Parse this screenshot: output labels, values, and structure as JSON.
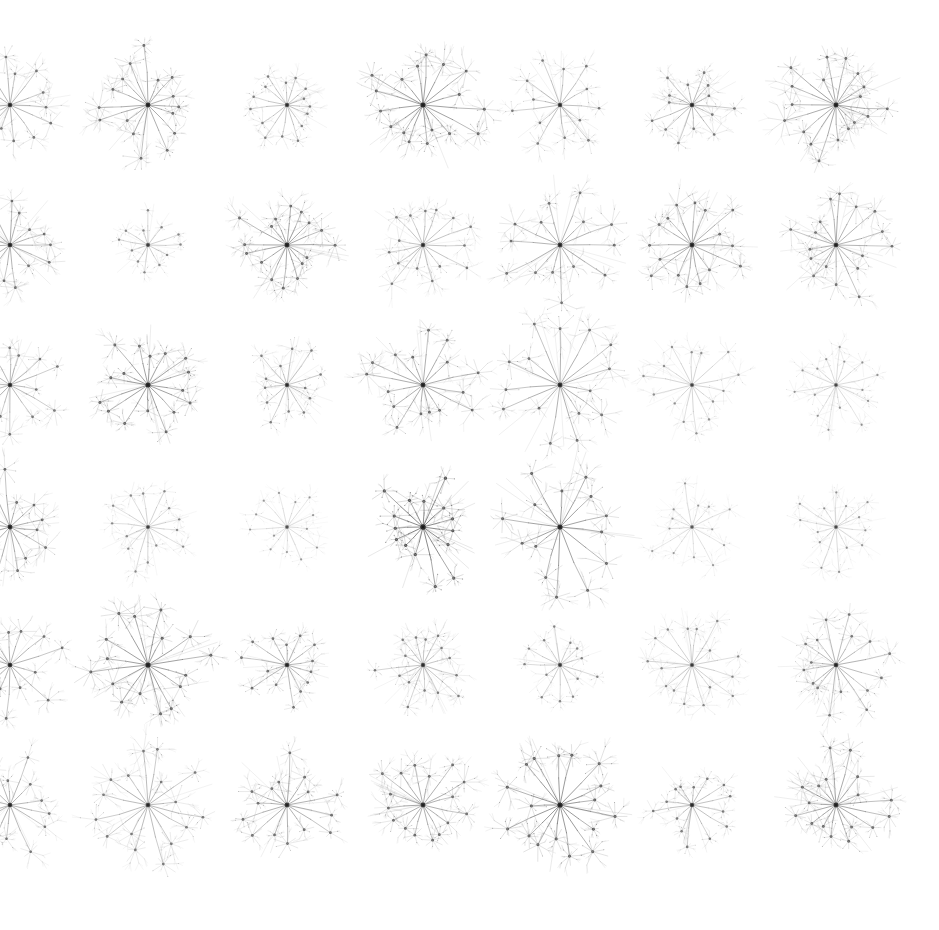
{
  "figure": {
    "type": "small-multiples-grid",
    "width": 939,
    "height": 930,
    "background_color": "#ffffff",
    "ink_color": "#3a3a3a",
    "rows": 6,
    "columns": 7,
    "total_cells": 42,
    "column_centers_x": [
      10,
      148,
      287,
      423,
      560,
      692,
      836
    ],
    "row_centers_y": [
      105,
      245,
      385,
      527,
      665,
      805
    ],
    "left_column_clipped": true
  },
  "glyph_model": {
    "description": "Each cell is a radial tree: one dark central hub, a ring of spoke edges to secondary hubs, each secondary hub emitting a small spray of leaf filaments.",
    "levels": 3,
    "hub_node_color": "#2b2b2b",
    "edge_color": "#555555",
    "leaf_color": "#8a8a8a"
  },
  "chart_data": {
    "type": "scatter",
    "subtitle": "42 small-multiple force-directed / radial star graphs",
    "xlabel": "",
    "ylabel": "",
    "grid": false,
    "legend": null,
    "xlim": [
      0,
      939
    ],
    "ylim": [
      0,
      930
    ],
    "cells": [
      {
        "row": 0,
        "col": 0,
        "cx": 10,
        "cy": 105,
        "radius": 56,
        "spokes": 14,
        "leaves": 7,
        "opacity": 0.62,
        "seed": 101,
        "spread": 0.96,
        "line_w": 0.55
      },
      {
        "row": 0,
        "col": 1,
        "cx": 148,
        "cy": 105,
        "radius": 58,
        "spokes": 16,
        "leaves": 8,
        "opacity": 0.7,
        "seed": 102,
        "spread": 1.0,
        "line_w": 0.58
      },
      {
        "row": 0,
        "col": 2,
        "cx": 287,
        "cy": 105,
        "radius": 44,
        "spokes": 15,
        "leaves": 7,
        "opacity": 0.55,
        "seed": 103,
        "spread": 0.9,
        "line_w": 0.5
      },
      {
        "row": 0,
        "col": 3,
        "cx": 423,
        "cy": 105,
        "radius": 60,
        "spokes": 17,
        "leaves": 8,
        "opacity": 0.74,
        "seed": 104,
        "spread": 1.02,
        "line_w": 0.62
      },
      {
        "row": 0,
        "col": 4,
        "cx": 560,
        "cy": 105,
        "radius": 50,
        "spokes": 13,
        "leaves": 7,
        "opacity": 0.58,
        "seed": 105,
        "spread": 0.98,
        "line_w": 0.52
      },
      {
        "row": 0,
        "col": 5,
        "cx": 692,
        "cy": 105,
        "radius": 48,
        "spokes": 14,
        "leaves": 7,
        "opacity": 0.6,
        "seed": 106,
        "spread": 0.94,
        "line_w": 0.54
      },
      {
        "row": 0,
        "col": 6,
        "cx": 836,
        "cy": 105,
        "radius": 60,
        "spokes": 18,
        "leaves": 8,
        "opacity": 0.72,
        "seed": 107,
        "spread": 1.0,
        "line_w": 0.58
      },
      {
        "row": 1,
        "col": 0,
        "cx": 10,
        "cy": 245,
        "radius": 54,
        "spokes": 15,
        "leaves": 7,
        "opacity": 0.66,
        "seed": 201,
        "spread": 0.96,
        "line_w": 0.56
      },
      {
        "row": 1,
        "col": 1,
        "cx": 148,
        "cy": 245,
        "radius": 40,
        "spokes": 12,
        "leaves": 6,
        "opacity": 0.48,
        "seed": 202,
        "spread": 0.88,
        "line_w": 0.48
      },
      {
        "row": 1,
        "col": 2,
        "cx": 287,
        "cy": 245,
        "radius": 56,
        "spokes": 16,
        "leaves": 8,
        "opacity": 0.72,
        "seed": 203,
        "spread": 0.98,
        "line_w": 0.6
      },
      {
        "row": 1,
        "col": 3,
        "cx": 423,
        "cy": 245,
        "radius": 52,
        "spokes": 15,
        "leaves": 7,
        "opacity": 0.56,
        "seed": 204,
        "spread": 0.96,
        "line_w": 0.52
      },
      {
        "row": 1,
        "col": 4,
        "cx": 560,
        "cy": 245,
        "radius": 58,
        "spokes": 14,
        "leaves": 8,
        "opacity": 0.64,
        "seed": 205,
        "spread": 1.04,
        "line_w": 0.58
      },
      {
        "row": 1,
        "col": 5,
        "cx": 692,
        "cy": 245,
        "radius": 56,
        "spokes": 16,
        "leaves": 8,
        "opacity": 0.68,
        "seed": 206,
        "spread": 0.98,
        "line_w": 0.58
      },
      {
        "row": 1,
        "col": 6,
        "cx": 836,
        "cy": 245,
        "radius": 56,
        "spokes": 17,
        "leaves": 8,
        "opacity": 0.66,
        "seed": 207,
        "spread": 1.0,
        "line_w": 0.56
      },
      {
        "row": 2,
        "col": 0,
        "cx": 10,
        "cy": 385,
        "radius": 52,
        "spokes": 14,
        "leaves": 7,
        "opacity": 0.62,
        "seed": 301,
        "spread": 0.96,
        "line_w": 0.54
      },
      {
        "row": 2,
        "col": 1,
        "cx": 148,
        "cy": 385,
        "radius": 54,
        "spokes": 16,
        "leaves": 8,
        "opacity": 0.74,
        "seed": 302,
        "spread": 0.96,
        "line_w": 0.62
      },
      {
        "row": 2,
        "col": 2,
        "cx": 287,
        "cy": 385,
        "radius": 46,
        "spokes": 13,
        "leaves": 7,
        "opacity": 0.56,
        "seed": 303,
        "spread": 0.92,
        "line_w": 0.5
      },
      {
        "row": 2,
        "col": 3,
        "cx": 423,
        "cy": 385,
        "radius": 56,
        "spokes": 16,
        "leaves": 8,
        "opacity": 0.7,
        "seed": 304,
        "spread": 1.0,
        "line_w": 0.58
      },
      {
        "row": 2,
        "col": 4,
        "cx": 560,
        "cy": 385,
        "radius": 62,
        "spokes": 15,
        "leaves": 8,
        "opacity": 0.66,
        "seed": 305,
        "spread": 1.06,
        "line_w": 0.58
      },
      {
        "row": 2,
        "col": 5,
        "cx": 692,
        "cy": 385,
        "radius": 52,
        "spokes": 14,
        "leaves": 7,
        "opacity": 0.44,
        "seed": 306,
        "spread": 0.98,
        "line_w": 0.46
      },
      {
        "row": 2,
        "col": 6,
        "cx": 836,
        "cy": 385,
        "radius": 50,
        "spokes": 15,
        "leaves": 7,
        "opacity": 0.4,
        "seed": 307,
        "spread": 0.96,
        "line_w": 0.44
      },
      {
        "row": 3,
        "col": 0,
        "cx": 10,
        "cy": 527,
        "radius": 56,
        "spokes": 14,
        "leaves": 7,
        "opacity": 0.68,
        "seed": 401,
        "spread": 1.0,
        "line_w": 0.58
      },
      {
        "row": 3,
        "col": 1,
        "cx": 148,
        "cy": 527,
        "radius": 48,
        "spokes": 14,
        "leaves": 7,
        "opacity": 0.46,
        "seed": 402,
        "spread": 0.94,
        "line_w": 0.46
      },
      {
        "row": 3,
        "col": 2,
        "cx": 287,
        "cy": 527,
        "radius": 42,
        "spokes": 13,
        "leaves": 6,
        "opacity": 0.38,
        "seed": 403,
        "spread": 0.88,
        "line_w": 0.42
      },
      {
        "row": 3,
        "col": 3,
        "cx": 423,
        "cy": 527,
        "radius": 58,
        "spokes": 15,
        "leaves": 7,
        "opacity": 0.82,
        "seed": 404,
        "spread": 1.02,
        "line_w": 0.7
      },
      {
        "row": 3,
        "col": 4,
        "cx": 560,
        "cy": 527,
        "radius": 64,
        "spokes": 14,
        "leaves": 7,
        "opacity": 0.72,
        "seed": 405,
        "spread": 1.1,
        "line_w": 0.64
      },
      {
        "row": 3,
        "col": 5,
        "cx": 692,
        "cy": 527,
        "radius": 48,
        "spokes": 13,
        "leaves": 7,
        "opacity": 0.36,
        "seed": 406,
        "spread": 0.94,
        "line_w": 0.42
      },
      {
        "row": 3,
        "col": 6,
        "cx": 836,
        "cy": 527,
        "radius": 48,
        "spokes": 14,
        "leaves": 7,
        "opacity": 0.4,
        "seed": 407,
        "spread": 0.94,
        "line_w": 0.44
      },
      {
        "row": 4,
        "col": 0,
        "cx": 10,
        "cy": 665,
        "radius": 54,
        "spokes": 14,
        "leaves": 7,
        "opacity": 0.66,
        "seed": 501,
        "spread": 0.98,
        "line_w": 0.56
      },
      {
        "row": 4,
        "col": 1,
        "cx": 148,
        "cy": 665,
        "radius": 60,
        "spokes": 16,
        "leaves": 8,
        "opacity": 0.74,
        "seed": 502,
        "spread": 1.02,
        "line_w": 0.64
      },
      {
        "row": 4,
        "col": 2,
        "cx": 287,
        "cy": 665,
        "radius": 48,
        "spokes": 14,
        "leaves": 7,
        "opacity": 0.64,
        "seed": 503,
        "spread": 0.94,
        "line_w": 0.54
      },
      {
        "row": 4,
        "col": 3,
        "cx": 423,
        "cy": 665,
        "radius": 50,
        "spokes": 15,
        "leaves": 7,
        "opacity": 0.56,
        "seed": 504,
        "spread": 0.94,
        "line_w": 0.5
      },
      {
        "row": 4,
        "col": 4,
        "cx": 560,
        "cy": 665,
        "radius": 44,
        "spokes": 13,
        "leaves": 6,
        "opacity": 0.5,
        "seed": 505,
        "spread": 0.9,
        "line_w": 0.48
      },
      {
        "row": 4,
        "col": 5,
        "cx": 692,
        "cy": 665,
        "radius": 52,
        "spokes": 16,
        "leaves": 8,
        "opacity": 0.48,
        "seed": 506,
        "spread": 0.96,
        "line_w": 0.46
      },
      {
        "row": 4,
        "col": 6,
        "cx": 836,
        "cy": 665,
        "radius": 54,
        "spokes": 16,
        "leaves": 8,
        "opacity": 0.62,
        "seed": 507,
        "spread": 0.98,
        "line_w": 0.54
      },
      {
        "row": 5,
        "col": 0,
        "cx": 10,
        "cy": 805,
        "radius": 52,
        "spokes": 14,
        "leaves": 7,
        "opacity": 0.64,
        "seed": 601,
        "spread": 0.96,
        "line_w": 0.54
      },
      {
        "row": 5,
        "col": 1,
        "cx": 148,
        "cy": 805,
        "radius": 58,
        "spokes": 16,
        "leaves": 8,
        "opacity": 0.6,
        "seed": 602,
        "spread": 1.02,
        "line_w": 0.56
      },
      {
        "row": 5,
        "col": 2,
        "cx": 287,
        "cy": 805,
        "radius": 54,
        "spokes": 15,
        "leaves": 7,
        "opacity": 0.66,
        "seed": 603,
        "spread": 0.98,
        "line_w": 0.58
      },
      {
        "row": 5,
        "col": 3,
        "cx": 423,
        "cy": 805,
        "radius": 56,
        "spokes": 16,
        "leaves": 8,
        "opacity": 0.68,
        "seed": 604,
        "spread": 0.98,
        "line_w": 0.58
      },
      {
        "row": 5,
        "col": 4,
        "cx": 560,
        "cy": 805,
        "radius": 60,
        "spokes": 17,
        "leaves": 8,
        "opacity": 0.76,
        "seed": 605,
        "spread": 1.02,
        "line_w": 0.66
      },
      {
        "row": 5,
        "col": 5,
        "cx": 692,
        "cy": 805,
        "radius": 46,
        "spokes": 14,
        "leaves": 7,
        "opacity": 0.58,
        "seed": 606,
        "spread": 0.92,
        "line_w": 0.52
      },
      {
        "row": 5,
        "col": 6,
        "cx": 836,
        "cy": 805,
        "radius": 56,
        "spokes": 17,
        "leaves": 8,
        "opacity": 0.7,
        "seed": 607,
        "spread": 1.0,
        "line_w": 0.6
      }
    ]
  }
}
